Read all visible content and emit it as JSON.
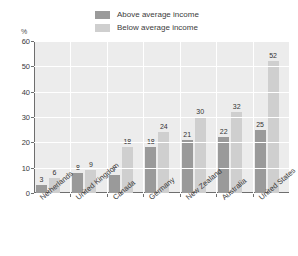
{
  "title": "",
  "axis": {
    "unit_label": "%",
    "y_ticks": [
      "60",
      "50",
      "40",
      "30",
      "20",
      "10",
      "0"
    ],
    "ylim": [
      0,
      60
    ]
  },
  "legend": {
    "items": [
      {
        "label": "Above average income",
        "color": "#9a9a9a",
        "swatch_name": "legend-swatch-above"
      },
      {
        "label": "Below average income",
        "color": "#cfcfcf",
        "swatch_name": "legend-swatch-below"
      }
    ]
  },
  "chart_data": {
    "type": "bar",
    "title": "",
    "subtitle": "",
    "xlabel": "",
    "ylabel": "%",
    "ylim": [
      0,
      60
    ],
    "yticks": [
      0,
      10,
      20,
      30,
      40,
      50,
      60
    ],
    "grid": true,
    "legend_position": "top-center",
    "categories": [
      "Netherlands",
      "United Kingdom",
      "Canada",
      "Germany",
      "New Zealand",
      "Australia",
      "United States"
    ],
    "series": [
      {
        "name": "Above average income",
        "color": "#9a9a9a",
        "values": [
          3,
          8,
          7,
          18,
          21,
          22,
          25
        ]
      },
      {
        "name": "Below average income",
        "color": "#cfcfcf",
        "values": [
          6,
          9,
          18,
          24,
          30,
          32,
          52
        ]
      }
    ]
  },
  "colors": {
    "plot_background": "#ececec",
    "gridline": "#ffffff",
    "axis_line": "#6e6e6e",
    "above_bar": "#9a9a9a",
    "below_bar": "#cfcfcf",
    "text": "#3a3a3a"
  }
}
